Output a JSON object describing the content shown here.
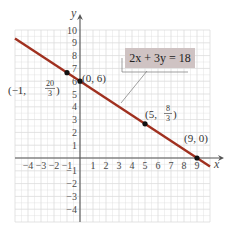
{
  "chart_data": {
    "type": "line",
    "title": "",
    "xlabel": "x",
    "ylabel": "y",
    "xlim": [
      -5,
      10
    ],
    "ylim": [
      -5,
      10
    ],
    "grid": true,
    "x_ticks": [
      -4,
      -3,
      -2,
      -1,
      1,
      2,
      3,
      4,
      5,
      6,
      7,
      8,
      9
    ],
    "y_ticks": [
      -4,
      -3,
      -2,
      -1,
      1,
      2,
      3,
      4,
      5,
      6,
      7,
      8,
      9,
      10
    ],
    "x_tick_labels": [
      "−4",
      "−3",
      "−2",
      "−1",
      "1",
      "2",
      "3",
      "4",
      "5",
      "6",
      "7",
      "8",
      "9"
    ],
    "y_tick_labels": [
      "−4",
      "−3",
      "−2",
      "−1",
      "1",
      "2",
      "3",
      "4",
      "5",
      "6",
      "7",
      "8",
      "9",
      "10"
    ],
    "series": [
      {
        "name": "2x + 3y = 18",
        "equation": "2x + 3y = 18",
        "slope": -0.6667,
        "intercept": 6,
        "color": "#a0301f",
        "x": [
          -5,
          10
        ],
        "y": [
          9.333,
          -0.667
        ]
      }
    ],
    "points": [
      {
        "x": -1,
        "y": 6.667,
        "label": "(−1, 20/3)"
      },
      {
        "x": 0,
        "y": 6,
        "label": "(0, 6)"
      },
      {
        "x": 5,
        "y": 2.667,
        "label": "(5, 8/3)"
      },
      {
        "x": 9,
        "y": 0,
        "label": "(9, 0)"
      }
    ],
    "annotations": [
      {
        "text": "2x + 3y = 18",
        "type": "callout-box",
        "fill": "#cfc3c3"
      }
    ]
  },
  "labels": {
    "x_axis": "x",
    "y_axis": "y",
    "equation": "2x + 3y = 18",
    "pt_a_prefix": "(−1, ",
    "pt_a_num": "20",
    "pt_a_den": "3",
    "pt_a_suffix": ")",
    "pt_b": "(0, 6)",
    "pt_c_prefix": "(5, ",
    "pt_c_num": "8",
    "pt_c_den": "3",
    "pt_c_suffix": ")",
    "pt_d": "(9, 0)"
  },
  "colors": {
    "line": "#a0301f",
    "grid": "#dcdcdc",
    "axis": "#555555",
    "callout_fill": "#cfc3c3",
    "point": "#111111"
  }
}
